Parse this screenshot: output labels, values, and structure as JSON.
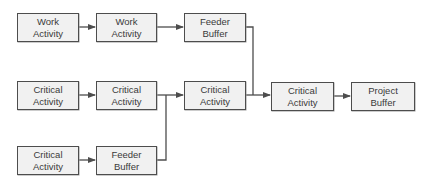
{
  "diagram": {
    "type": "critical-chain-network",
    "colors": {
      "box_fill": "#f1f1f1",
      "box_border": "#4d4d4d",
      "line": "#4d4d4d",
      "text": "#3a3a3a"
    },
    "nodes": [
      {
        "id": "n1",
        "line1": "Work",
        "line2": "Activity"
      },
      {
        "id": "n2",
        "line1": "Work",
        "line2": "Activity"
      },
      {
        "id": "n3",
        "line1": "Feeder",
        "line2": "Buffer"
      },
      {
        "id": "n4",
        "line1": "Critical",
        "line2": "Activity"
      },
      {
        "id": "n5",
        "line1": "Critical",
        "line2": "Activity"
      },
      {
        "id": "n6",
        "line1": "Critical",
        "line2": "Activity"
      },
      {
        "id": "n7",
        "line1": "Critical",
        "line2": "Activity"
      },
      {
        "id": "n8",
        "line1": "Project",
        "line2": "Buffer"
      },
      {
        "id": "n9",
        "line1": "Critical",
        "line2": "Activity"
      },
      {
        "id": "n10",
        "line1": "Feeder",
        "line2": "Buffer"
      }
    ],
    "edges": [
      {
        "from": "n1",
        "to": "n2"
      },
      {
        "from": "n2",
        "to": "n3"
      },
      {
        "from": "n3",
        "to": "n7"
      },
      {
        "from": "n4",
        "to": "n5"
      },
      {
        "from": "n5",
        "to": "n6"
      },
      {
        "from": "n6",
        "to": "n7"
      },
      {
        "from": "n7",
        "to": "n8"
      },
      {
        "from": "n9",
        "to": "n10"
      },
      {
        "from": "n10",
        "to": "n6"
      }
    ]
  }
}
